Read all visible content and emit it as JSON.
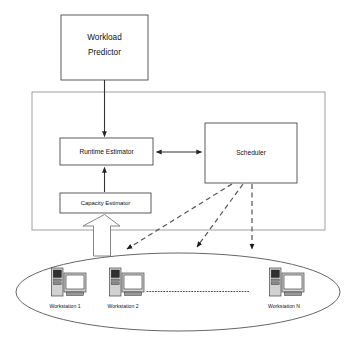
{
  "diagram": {
    "type": "block-diagram",
    "background_color": "#ffffff",
    "line_color": "#333333",
    "frame_color": "#888888"
  },
  "nodes": {
    "workload_predictor": {
      "label_line1": "Workload",
      "label_line2": "Predictor",
      "x": 61,
      "y": 15,
      "w": 87,
      "h": 65
    },
    "runtime_estimator": {
      "label": "Runtime Estimator",
      "x": 60,
      "y": 138,
      "w": 93,
      "h": 27
    },
    "scheduler": {
      "label": "Scheduler",
      "x": 205,
      "y": 123,
      "w": 92,
      "h": 60
    },
    "capacity_estimator": {
      "label": "Capacity Estimator",
      "x": 60,
      "y": 193,
      "w": 91,
      "h": 20
    }
  },
  "frame": {
    "name": "middleware-frame",
    "x": 32,
    "y": 92,
    "w": 293,
    "h": 138
  },
  "cluster": {
    "name": "workstation-cloud",
    "ellipse_cx": 178,
    "ellipse_cy": 292,
    "ellipse_rx": 162,
    "ellipse_ry": 39,
    "ellipsis_label": "..............................................",
    "workstations": [
      {
        "label": "Workstation 1",
        "cx": 62,
        "cy": 285
      },
      {
        "label": "Workstation 2",
        "cx": 120,
        "cy": 285
      },
      {
        "label": "Workstation  N",
        "cx": 280,
        "cy": 285
      }
    ]
  },
  "connectors": [
    {
      "name": "predictor-to-runtime",
      "style": "solid",
      "arrow": "single-down"
    },
    {
      "name": "runtime-to-scheduler",
      "style": "solid",
      "arrow": "double"
    },
    {
      "name": "capacity-to-runtime",
      "style": "solid",
      "arrow": "single-up"
    },
    {
      "name": "scheduler-to-workstation-1",
      "style": "dashed",
      "arrow": "single"
    },
    {
      "name": "scheduler-to-workstation-2",
      "style": "dashed",
      "arrow": "single"
    },
    {
      "name": "scheduler-to-workstation-n",
      "style": "dashed",
      "arrow": "single"
    },
    {
      "name": "cluster-to-capacity",
      "style": "block-arrow",
      "arrow": "single-up"
    }
  ]
}
